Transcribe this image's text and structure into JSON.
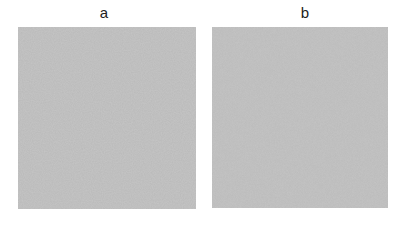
{
  "panels": [
    {
      "label": "a",
      "texture": "gray-noise-coarse",
      "base_color": "#b9b9b9"
    },
    {
      "label": "b",
      "texture": "gray-noise-fine",
      "base_color": "#bababa"
    }
  ]
}
